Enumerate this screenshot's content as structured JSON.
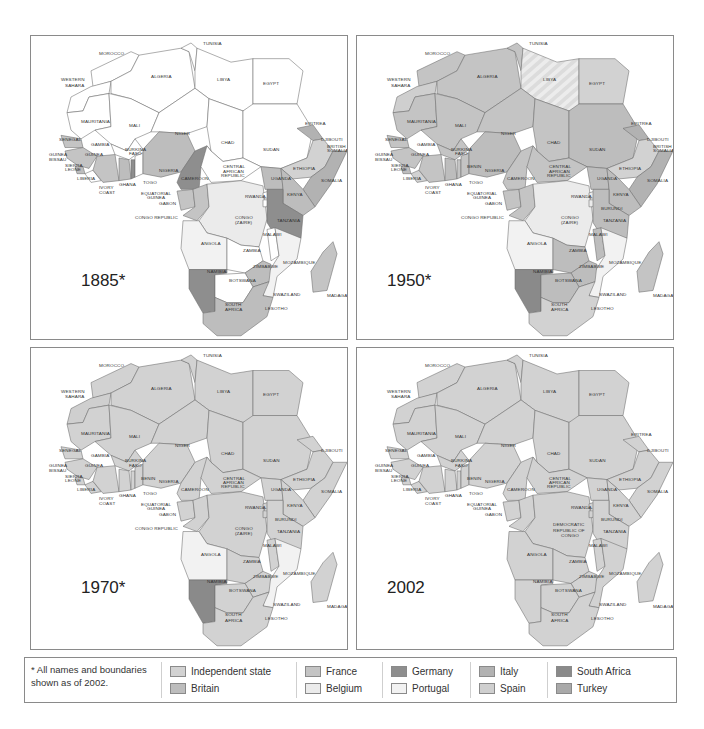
{
  "figure": {
    "maps": [
      {
        "year_label": "1885*",
        "region": "Africa"
      },
      {
        "year_label": "1950*",
        "region": "Africa"
      },
      {
        "year_label": "1970*",
        "region": "Africa"
      },
      {
        "year_label": "2002",
        "region": "Africa"
      }
    ],
    "country_labels": {
      "morocco": "MOROCCO",
      "tunisia": "TUNISIA",
      "western_sahara_1": "WESTERN",
      "western_sahara_2": "SAHARA",
      "algeria": "ALGERIA",
      "libya": "LIBYA",
      "egypt": "EGYPT",
      "mauritania": "MAURITANIA",
      "mali": "MALI",
      "niger": "NIGER",
      "chad": "CHAD",
      "sudan": "SUDAN",
      "eritrea": "ERITREA",
      "djibouti": "DJIBOUTI",
      "british_somalia_1": "BRITISH",
      "british_somalia_2": "SOMALIA",
      "senegal": "SENEGAL",
      "gambia": "GAMBIA",
      "guinea_bissau_1": "GUINEA",
      "guinea_bissau_2": "BISSAU",
      "guinea": "GUINEA",
      "sierra_leone_1": "SIERRA",
      "sierra_leone_2": "LEONE",
      "liberia": "LIBERIA",
      "ivory_coast_1": "IVORY",
      "ivory_coast_2": "COAST",
      "burkina_1": "BURKINA",
      "burkina_2": "FASO",
      "ghana": "GHANA",
      "togo": "TOGO",
      "benin": "BENIN",
      "nigeria": "NIGERIA",
      "cameroon": "CAMEROON",
      "car_1": "CENTRAL",
      "car_2": "AFRICAN",
      "car_3": "REPUBLIC",
      "ethiopia": "ETHIOPIA",
      "somalia": "SOMALIA",
      "uganda": "UGANDA",
      "kenya": "KENYA",
      "eq_guinea_1": "EQUATORIAL",
      "eq_guinea_2": "GUINEA",
      "gabon": "GABON",
      "congo_republic": "CONGO REPUBLIC",
      "rwanda": "RWANDA",
      "burundi": "BURUNDI",
      "congo_1": "CONGO",
      "congo_2": "(ZAIRE)",
      "drc_1": "DEMOCRATIC",
      "drc_2": "REPUBLIC OF",
      "drc_3": "CONGO",
      "tanzania": "TANZANIA",
      "malawi": "MALAWI",
      "angola": "ANGOLA",
      "zambia": "ZAMBIA",
      "mozambique": "MOZAMBIQUE",
      "zimbabwe": "ZIMBABWE",
      "namibia": "NAMIBIA",
      "botswana": "BOTSWANA",
      "madagascar": "MADAGASCAR",
      "swaziland": "SWAZILAND",
      "south_africa_1": "SOUTH",
      "south_africa_2": "AFRICA",
      "lesotho": "LESOTHO"
    }
  },
  "legend": {
    "note": "* All names and boundaries shown as of 2002.",
    "items": [
      {
        "label": "Independent state",
        "color": "#d2d2d2"
      },
      {
        "label": "Britain",
        "color": "#bdbdbd"
      },
      {
        "label": "France",
        "color": "#c4c4c4"
      },
      {
        "label": "Belgium",
        "color": "#ebebeb"
      },
      {
        "label": "Germany",
        "color": "#8e8e8e"
      },
      {
        "label": "Portugal",
        "color": "#f2f2f2"
      },
      {
        "label": "Italy",
        "color": "#b2b2b2"
      },
      {
        "label": "Spain",
        "color": "#cfcfcf"
      },
      {
        "label": "South Africa",
        "color": "#8a8a8a"
      },
      {
        "label": "Turkey",
        "color": "#a9a9a9"
      }
    ]
  },
  "chart_data": {
    "type": "table",
    "panels": [
      "1885*",
      "1950*",
      "1970*",
      "2002"
    ],
    "legend": [
      "Independent state",
      "Britain",
      "France",
      "Belgium",
      "Germany",
      "Portugal",
      "Italy",
      "Spain",
      "South Africa",
      "Turkey"
    ],
    "footnote": "* All names and boundaries shown as of 2002.",
    "notable": {
      "1885": {
        "Germany": [
          "Namibia",
          "Cameroon",
          "Tanzania",
          "Togo"
        ],
        "Britain": [
          "South Africa",
          "Nigeria coast",
          "Gold Coast",
          "Sierra Leone",
          "Gambia"
        ],
        "France": [
          "Senegal",
          "Guinea",
          "Ivory Coast interior",
          "Gabon",
          "Madagascar"
        ],
        "Belgium": [
          "Congo (Zaire)"
        ],
        "Portugal": [
          "Angola coast",
          "Mozambique coast"
        ],
        "Italy": [
          "Eritrea",
          "Somalia"
        ],
        "Independent state": [
          "Ethiopia",
          "Morocco",
          "Liberia",
          "most of interior"
        ]
      },
      "1950": {
        "Belgium": [
          "Congo (Zaire)",
          "Rwanda",
          "Burundi"
        ],
        "Portugal": [
          "Angola",
          "Mozambique",
          "Guinea-Bissau"
        ],
        "South Africa": [
          "Namibia"
        ],
        "Italy": [
          "Somalia"
        ],
        "Independent state": [
          "Libya",
          "Egypt",
          "Ethiopia",
          "Liberia",
          "South Africa"
        ]
      },
      "1970": {
        "Portugal": [
          "Angola",
          "Mozambique"
        ],
        "South Africa": [
          "Namibia"
        ],
        "Spain": [
          "Western Sahara"
        ],
        "Independent state": [
          "most countries"
        ]
      },
      "2002": {
        "Independent state": [
          "all countries"
        ]
      }
    }
  }
}
